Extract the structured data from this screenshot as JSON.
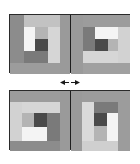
{
  "figure": {
    "rows": [
      {
        "position": "top",
        "blocks": [
          {
            "position": "left",
            "patches": [
              {
                "name": "outer-left-strip",
                "x": 0,
                "y": 0,
                "w": 14,
                "h": 48,
                "color": "#8c8c8c"
              },
              {
                "name": "outer-top-strip",
                "x": 14,
                "y": 0,
                "w": 36,
                "h": 12,
                "color": "#c2c2c2"
              },
              {
                "name": "outer-right-strip",
                "x": 50,
                "y": 0,
                "w": 10,
                "h": 59,
                "color": "#9a9a9a"
              },
              {
                "name": "outer-bottom-strip",
                "x": 0,
                "y": 48,
                "w": 50,
                "h": 11,
                "color": "#9c9c9c"
              },
              {
                "name": "inner-white",
                "x": 14,
                "y": 12,
                "w": 11,
                "h": 24,
                "color": "#f4f4f4"
              },
              {
                "name": "inner-light-square",
                "x": 25,
                "y": 12,
                "w": 13,
                "h": 12,
                "color": "#b4b4b4"
              },
              {
                "name": "center-dark-square",
                "x": 25,
                "y": 24,
                "w": 13,
                "h": 12,
                "color": "#4a4a4a"
              },
              {
                "name": "inner-right-light",
                "x": 38,
                "y": 12,
                "w": 12,
                "h": 36,
                "color": "#d6d6d6"
              },
              {
                "name": "inner-bottom-medium",
                "x": 14,
                "y": 36,
                "w": 24,
                "h": 12,
                "color": "#7a7a7a"
              }
            ]
          },
          {
            "position": "right",
            "patches": [
              {
                "name": "outer-left-strip",
                "x": 0,
                "y": 0,
                "w": 12,
                "h": 59,
                "color": "#9a9a9a"
              },
              {
                "name": "outer-top-strip",
                "x": 12,
                "y": 0,
                "w": 47,
                "h": 12,
                "color": "#9c9c9c"
              },
              {
                "name": "outer-right-strip",
                "x": 47,
                "y": 12,
                "w": 12,
                "h": 36,
                "color": "#d2d2d2"
              },
              {
                "name": "outer-bottom-strip",
                "x": 12,
                "y": 48,
                "w": 47,
                "h": 11,
                "color": "#a0a0a0"
              },
              {
                "name": "inner-left-medium",
                "x": 12,
                "y": 12,
                "w": 12,
                "h": 24,
                "color": "#7a7a7a"
              },
              {
                "name": "inner-white",
                "x": 24,
                "y": 12,
                "w": 23,
                "h": 12,
                "color": "#f4f4f4"
              },
              {
                "name": "center-dark-square",
                "x": 24,
                "y": 24,
                "w": 13,
                "h": 12,
                "color": "#4a4a4a"
              },
              {
                "name": "inner-light-square",
                "x": 37,
                "y": 24,
                "w": 10,
                "h": 12,
                "color": "#b4b4b4"
              },
              {
                "name": "inner-bottom-light",
                "x": 12,
                "y": 36,
                "w": 35,
                "h": 12,
                "color": "#d6d6d6"
              }
            ]
          }
        ]
      },
      {
        "position": "bottom",
        "blocks": [
          {
            "position": "left",
            "patches": [
              {
                "name": "outer-top-strip",
                "x": 0,
                "y": 0,
                "w": 50,
                "h": 11,
                "color": "#9c9c9c"
              },
              {
                "name": "outer-left-strip",
                "x": 0,
                "y": 11,
                "w": 12,
                "h": 39,
                "color": "#d2d2d2"
              },
              {
                "name": "outer-right-strip",
                "x": 50,
                "y": 0,
                "w": 10,
                "h": 60,
                "color": "#9a9a9a"
              },
              {
                "name": "outer-bottom-strip",
                "x": 0,
                "y": 50,
                "w": 50,
                "h": 10,
                "color": "#8c8c8c"
              },
              {
                "name": "inner-top-light",
                "x": 12,
                "y": 11,
                "w": 38,
                "h": 11,
                "color": "#d6d6d6"
              },
              {
                "name": "inner-light-square",
                "x": 12,
                "y": 22,
                "w": 12,
                "h": 14,
                "color": "#b4b4b4"
              },
              {
                "name": "center-dark-square",
                "x": 24,
                "y": 22,
                "w": 13,
                "h": 14,
                "color": "#4a4a4a"
              },
              {
                "name": "inner-right-medium",
                "x": 37,
                "y": 22,
                "w": 13,
                "h": 28,
                "color": "#7a7a7a"
              },
              {
                "name": "inner-white",
                "x": 12,
                "y": 36,
                "w": 25,
                "h": 14,
                "color": "#f4f4f4"
              }
            ]
          },
          {
            "position": "right",
            "patches": [
              {
                "name": "outer-left-strip",
                "x": 0,
                "y": 0,
                "w": 11,
                "h": 60,
                "color": "#9a9a9a"
              },
              {
                "name": "outer-top-strip",
                "x": 11,
                "y": 0,
                "w": 48,
                "h": 11,
                "color": "#9c9c9c"
              },
              {
                "name": "outer-right-strip",
                "x": 47,
                "y": 11,
                "w": 12,
                "h": 49,
                "color": "#9c9c9c"
              },
              {
                "name": "outer-bottom-strip",
                "x": 11,
                "y": 50,
                "w": 36,
                "h": 10,
                "color": "#cfcfcf"
              },
              {
                "name": "inner-left-light",
                "x": 11,
                "y": 11,
                "w": 12,
                "h": 39,
                "color": "#dadada"
              },
              {
                "name": "inner-top-medium",
                "x": 23,
                "y": 11,
                "w": 24,
                "h": 11,
                "color": "#7a7a7a"
              },
              {
                "name": "center-dark-square",
                "x": 23,
                "y": 22,
                "w": 13,
                "h": 13,
                "color": "#4a4a4a"
              },
              {
                "name": "inner-light-square",
                "x": 23,
                "y": 35,
                "w": 13,
                "h": 15,
                "color": "#b4b4b4"
              },
              {
                "name": "inner-white",
                "x": 36,
                "y": 22,
                "w": 11,
                "h": 28,
                "color": "#f4f4f4"
              }
            ]
          }
        ]
      }
    ],
    "connector": {
      "icon": "double-arrow-left-right-icon",
      "color": "#1a1a1a"
    }
  }
}
